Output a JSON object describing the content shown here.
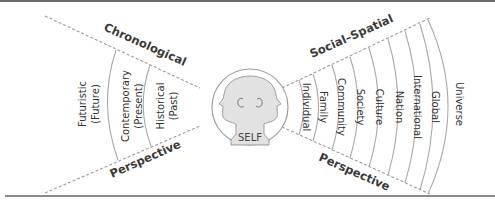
{
  "diagram": {
    "center_label": "SELF",
    "left_fan": {
      "title_top": "Chronological",
      "title_bottom": "Perspective",
      "bands": [
        {
          "line1": "Historical",
          "line2": "(Past)"
        },
        {
          "line1": "Contemporary",
          "line2": "(Present)"
        },
        {
          "line1": "Futuristic",
          "line2": "(Future)"
        }
      ]
    },
    "right_fan": {
      "title_top": "Social–Spatial",
      "title_bottom": "Perspective",
      "bands": [
        "Individual",
        "Family",
        "Community",
        "Society",
        "Culture",
        "Nation",
        "International",
        "Global",
        "Universe"
      ]
    },
    "colors": {
      "line": "#a8a8a8",
      "text": "#333333",
      "face_fill": "#e2e2e2",
      "rule": "#6b6b6b"
    }
  }
}
